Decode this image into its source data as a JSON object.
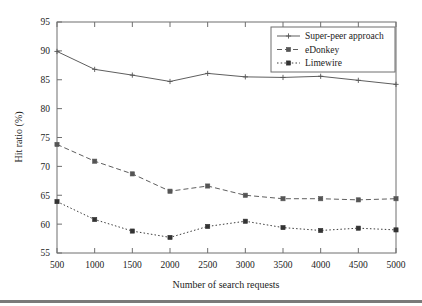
{
  "figure": {
    "background_color": "#ffffff",
    "frame_color": "#6f6f6f",
    "caption_rule": true
  },
  "chart_data": {
    "type": "line",
    "title": "",
    "subtitle": "",
    "xlabel": "Number of search requests",
    "ylabel": "Hit ratio (%)",
    "x": [
      500,
      1000,
      1500,
      2000,
      2500,
      3000,
      3500,
      4000,
      4500,
      5000
    ],
    "xticklabels": [
      "500",
      "1000",
      "1500",
      "2000",
      "2500",
      "3000",
      "3500",
      "4000",
      "4500",
      "5000"
    ],
    "yticks": [
      55,
      60,
      65,
      70,
      75,
      80,
      85,
      90,
      95
    ],
    "yticklabels": [
      "55",
      "60",
      "65",
      "70",
      "75",
      "80",
      "85",
      "90",
      "95"
    ],
    "xlim": [
      500,
      5000
    ],
    "ylim": [
      55,
      95
    ],
    "grid": false,
    "legend_position": "upper right",
    "series": [
      {
        "name": "Super-peer approach",
        "linestyle": "solid",
        "marker": "plus",
        "color": "#555555",
        "values": [
          89.9,
          86.8,
          85.8,
          84.7,
          86.1,
          85.5,
          85.4,
          85.6,
          84.9,
          84.2
        ]
      },
      {
        "name": "eDonkey",
        "linestyle": "dashed",
        "marker": "square",
        "color": "#555555",
        "values": [
          73.8,
          70.9,
          68.7,
          65.7,
          66.6,
          65.0,
          64.4,
          64.4,
          64.2,
          64.4
        ]
      },
      {
        "name": "Limewire",
        "linestyle": "dotted",
        "marker": "square",
        "color": "#333333",
        "values": [
          63.9,
          60.8,
          58.8,
          57.7,
          59.6,
          60.5,
          59.4,
          58.9,
          59.3,
          59.0
        ]
      }
    ]
  }
}
